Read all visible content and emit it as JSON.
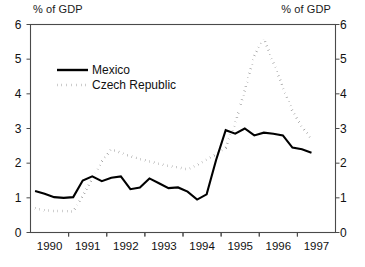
{
  "chart_data": {
    "type": "line",
    "title": "",
    "subtitle": "",
    "xlabel": "",
    "ylabel": "% of GDP",
    "ylabel_right": "% of GDP",
    "xlim": [
      1989.5,
      1997.5
    ],
    "ylim": [
      0,
      6
    ],
    "yticks": [
      0,
      1,
      2,
      3,
      4,
      5,
      6
    ],
    "xticks": [
      1990,
      1991,
      1992,
      1993,
      1994,
      1995,
      1996,
      1997
    ],
    "xtick_labels": [
      "1990",
      "1991",
      "1992",
      "1993",
      "1994",
      "1995",
      "1996",
      "1997"
    ],
    "ytick_labels": [
      "0",
      "1",
      "2",
      "3",
      "4",
      "5",
      "6"
    ],
    "grid": false,
    "legend_position": "upper-left-inside",
    "series": [
      {
        "name": "Mexico",
        "style": "solid",
        "color": "#000000",
        "points": [
          [
            1989.62,
            1.2
          ],
          [
            1989.87,
            1.12
          ],
          [
            1990.12,
            1.02
          ],
          [
            1990.37,
            1.0
          ],
          [
            1990.62,
            1.02
          ],
          [
            1990.87,
            1.5
          ],
          [
            1991.12,
            1.62
          ],
          [
            1991.37,
            1.48
          ],
          [
            1991.62,
            1.58
          ],
          [
            1991.87,
            1.62
          ],
          [
            1992.12,
            1.25
          ],
          [
            1992.37,
            1.3
          ],
          [
            1992.62,
            1.56
          ],
          [
            1992.87,
            1.42
          ],
          [
            1993.12,
            1.28
          ],
          [
            1993.37,
            1.3
          ],
          [
            1993.62,
            1.18
          ],
          [
            1993.87,
            0.95
          ],
          [
            1994.12,
            1.1
          ],
          [
            1994.37,
            2.1
          ],
          [
            1994.62,
            2.95
          ],
          [
            1994.87,
            2.85
          ],
          [
            1995.12,
            3.0
          ],
          [
            1995.37,
            2.8
          ],
          [
            1995.62,
            2.88
          ],
          [
            1995.87,
            2.85
          ],
          [
            1996.12,
            2.8
          ],
          [
            1996.37,
            2.45
          ],
          [
            1996.62,
            2.4
          ],
          [
            1996.87,
            2.3
          ]
        ]
      },
      {
        "name": "Czech Republic",
        "style": "dotted",
        "color": "#000000",
        "points": [
          [
            1989.62,
            0.7
          ],
          [
            1989.87,
            0.64
          ],
          [
            1990.12,
            0.62
          ],
          [
            1990.37,
            0.62
          ],
          [
            1990.62,
            0.6
          ],
          [
            1990.87,
            1.05
          ],
          [
            1991.12,
            1.55
          ],
          [
            1991.37,
            2.05
          ],
          [
            1991.62,
            2.4
          ],
          [
            1991.87,
            2.3
          ],
          [
            1992.12,
            2.2
          ],
          [
            1992.37,
            2.12
          ],
          [
            1992.62,
            2.05
          ],
          [
            1992.87,
            1.98
          ],
          [
            1993.12,
            1.92
          ],
          [
            1993.37,
            1.88
          ],
          [
            1993.62,
            1.82
          ],
          [
            1993.87,
            1.95
          ],
          [
            1994.12,
            2.1
          ],
          [
            1994.37,
            2.25
          ],
          [
            1994.62,
            2.45
          ],
          [
            1994.87,
            3.15
          ],
          [
            1995.12,
            4.1
          ],
          [
            1995.37,
            5.1
          ],
          [
            1995.62,
            5.6
          ],
          [
            1995.87,
            4.9
          ],
          [
            1996.12,
            4.2
          ],
          [
            1996.37,
            3.5
          ],
          [
            1996.62,
            3.05
          ],
          [
            1996.87,
            2.7
          ]
        ]
      }
    ],
    "legend": [
      "Mexico",
      "Czech Republic"
    ]
  },
  "axes": {
    "title_left": "% of GDP",
    "title_right": "% of GDP"
  },
  "colors": {
    "line": "#000000",
    "frame": "#4a4a4a",
    "text": "#111111",
    "background": "#ffffff"
  }
}
